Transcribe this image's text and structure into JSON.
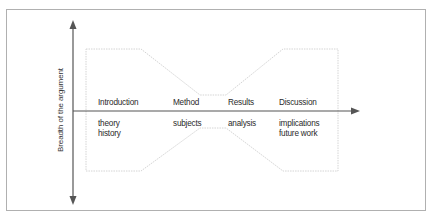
{
  "diagram": {
    "type": "hourglass-structure",
    "y_axis_label": "Breadth of the argument",
    "stages": [
      {
        "title": "Introduction",
        "details": [
          "theory",
          "history"
        ]
      },
      {
        "title": "Method",
        "details": [
          "subjects"
        ]
      },
      {
        "title": "Results",
        "details": [
          "analysis"
        ]
      },
      {
        "title": "Discussion",
        "details": [
          "implications",
          "future work"
        ]
      }
    ],
    "colors": {
      "frame": "#b0b0b0",
      "axis": "#555555",
      "outline": "#d4d4d4",
      "text": "#2a2a2a"
    }
  }
}
